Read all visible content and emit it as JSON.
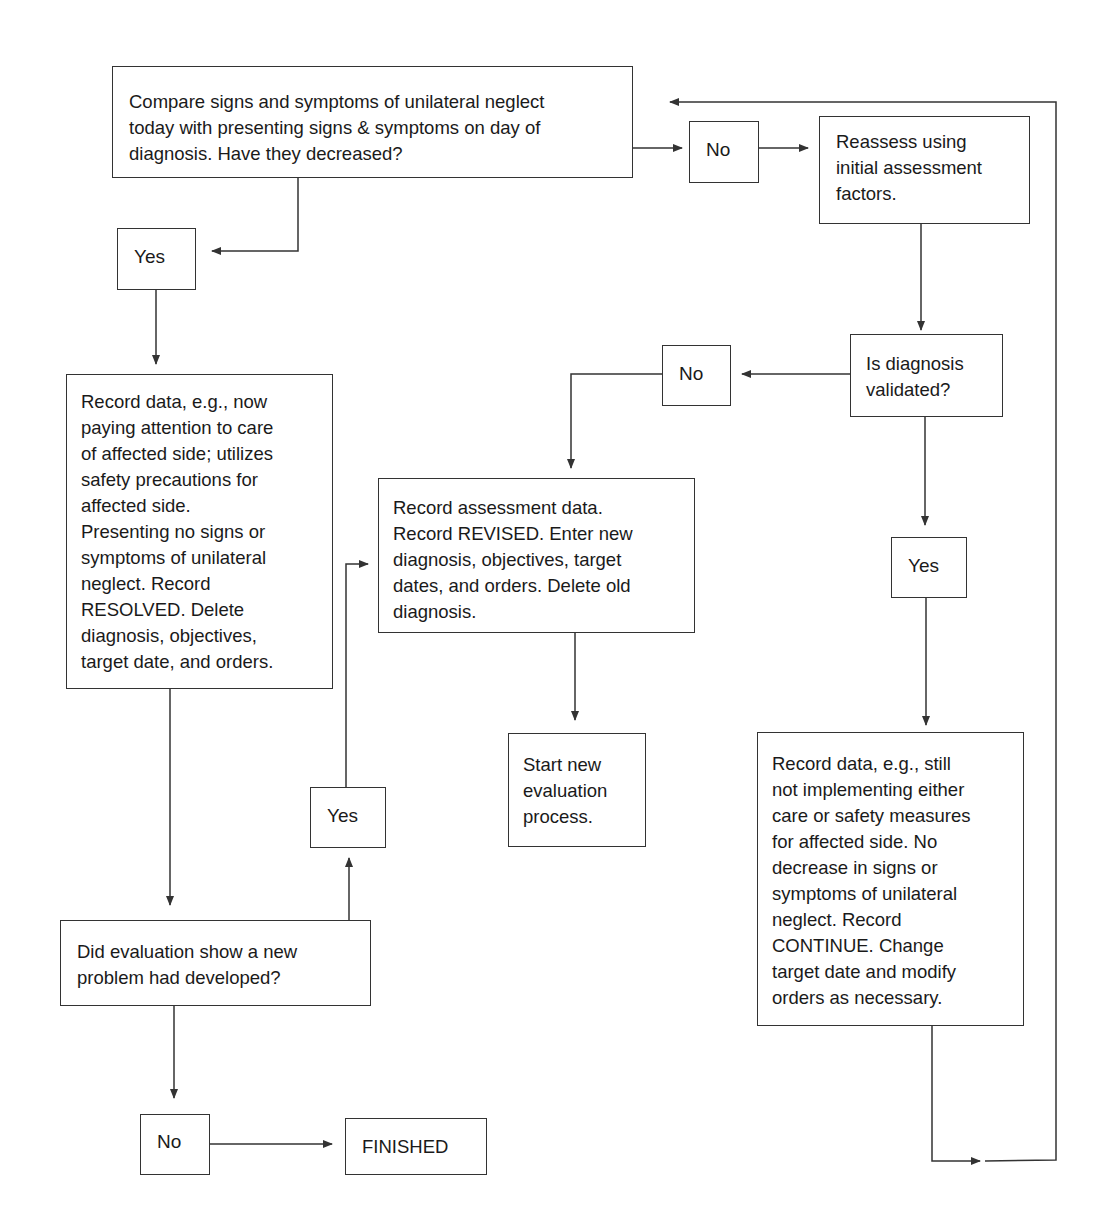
{
  "nodes": {
    "compare": {
      "text": "Compare signs and symptoms of unilateral neglect\ntoday with presenting signs & symptoms on day of\ndiagnosis. Have they decreased?"
    },
    "no_top": {
      "text": "No"
    },
    "reassess": {
      "text": "Reassess using\ninitial assessment\nfactors."
    },
    "yes_left": {
      "text": "Yes"
    },
    "validated": {
      "text": "Is diagnosis\nvalidated?"
    },
    "no_mid": {
      "text": "No"
    },
    "record_resolved": {
      "text": "Record data, e.g., now\npaying attention to care\nof affected side; utilizes\nsafety precautions for\naffected side.\nPresenting no signs or\nsymptoms of unilateral\nneglect. Record\nRESOLVED. Delete\ndiagnosis, objectives,\ntarget date, and orders."
    },
    "record_revised": {
      "text": "Record assessment data.\nRecord REVISED. Enter new\ndiagnosis, objectives, target\ndates, and orders. Delete old\ndiagnosis."
    },
    "yes_right": {
      "text": "Yes"
    },
    "start_new": {
      "text": "Start new\nevaluation\nprocess."
    },
    "yes_mid": {
      "text": "Yes"
    },
    "record_continue": {
      "text": "Record data, e.g., still\nnot implementing either\ncare or safety measures\nfor affected side. No\ndecrease in signs or\nsymptoms of unilateral\nneglect. Record\nCONTINUE. Change\ntarget date and modify\norders as necessary."
    },
    "new_problem": {
      "text": "Did evaluation show a new\nproblem had developed?"
    },
    "no_bottom": {
      "text": "No"
    },
    "finished": {
      "text": "FINISHED"
    }
  },
  "colors": {
    "line": "#333333",
    "background": "#ffffff",
    "text": "#1a1a1a"
  }
}
